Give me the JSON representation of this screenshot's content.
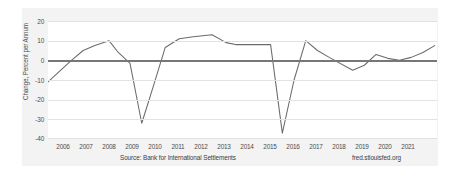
{
  "chart_data": {
    "type": "line",
    "title": "",
    "subtitle": "",
    "xlabel": "",
    "ylabel": "Change, Percent per Annum",
    "ylim": [
      -40,
      20
    ],
    "xlim": [
      2005.0,
      2021.6
    ],
    "yticks": [
      20,
      10,
      0,
      -10,
      -20,
      -30,
      -40
    ],
    "ytick_labels": [
      "20",
      "10",
      "0",
      "-10",
      "-20",
      "-30",
      "-40"
    ],
    "xticks": [
      2006,
      2007,
      2008,
      2009,
      2010,
      2011,
      2012,
      2013,
      2014,
      2015,
      2016,
      2017,
      2018,
      2019,
      2020,
      2021
    ],
    "xtick_labels": [
      "2006",
      "2007",
      "2008",
      "2009",
      "2010",
      "2011",
      "2012",
      "2013",
      "2014",
      "2015",
      "2016",
      "2017",
      "2018",
      "2019",
      "2020",
      "2021"
    ],
    "grid": true,
    "legend": false,
    "zero_reference_line": 0,
    "line_color": "#6b6b6b",
    "zero_line_color": "#777777",
    "grid_color": "#e2e2e2",
    "plot_background": "#ffffff",
    "figure_background": "#f3f3f3",
    "series": [
      {
        "name": "Change, Percent per Annum",
        "x": [
          2005.0,
          2005.5,
          2006.0,
          2006.5,
          2007.0,
          2007.6,
          2008.0,
          2008.5,
          2009.0,
          2009.5,
          2010.0,
          2010.6,
          2011.2,
          2012.0,
          2012.6,
          2013.0,
          2014.0,
          2014.5,
          2015.0,
          2015.5,
          2016.0,
          2016.5,
          2017.0,
          2018.0,
          2018.5,
          2019.0,
          2019.5,
          2020.0,
          2020.5,
          2021.0,
          2021.5
        ],
        "values": [
          -11.0,
          -5.5,
          0.0,
          5.0,
          7.5,
          10.0,
          4.0,
          -1.5,
          -32.0,
          -13.0,
          6.5,
          11.0,
          12.0,
          13.0,
          9.0,
          8.0,
          8.0,
          8.0,
          -37.0,
          -10.0,
          10.0,
          5.0,
          1.5,
          -5.0,
          -2.5,
          3.0,
          1.0,
          0.0,
          1.5,
          4.0,
          7.5
        ]
      }
    ],
    "annotations": {
      "source": "Source: Bank for International Settlements",
      "brand": "fred.stlouisfed.org"
    }
  }
}
